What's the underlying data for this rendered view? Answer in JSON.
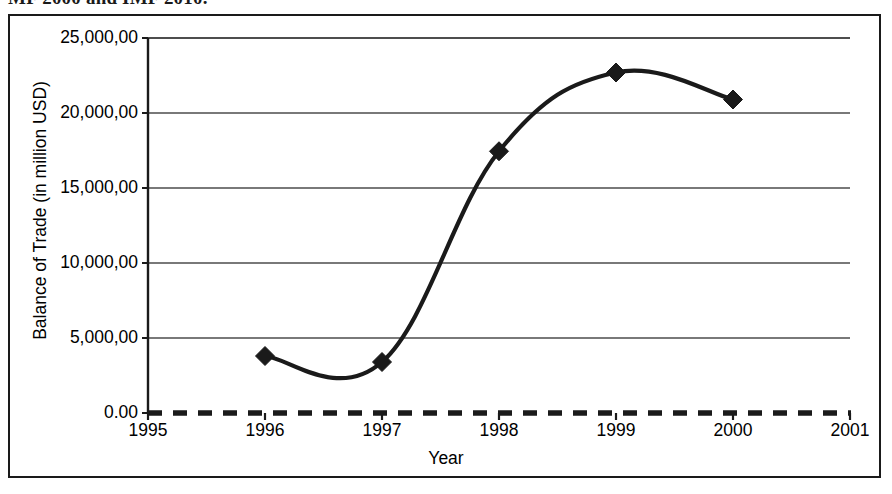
{
  "caption": {
    "text": "MF 2000 and IMF 2010."
  },
  "chart_data": {
    "type": "line",
    "title": "",
    "subtitle": "",
    "xlabel": "Year",
    "ylabel": "Balance of Trade (in million USD)",
    "x": [
      1996,
      1997,
      1998,
      1999,
      2000
    ],
    "values": [
      3800,
      3400,
      17450,
      22700,
      20900
    ],
    "series": [
      {
        "name": "Balance of Trade",
        "x": [
          1996,
          1997,
          1998,
          1999,
          2000
        ],
        "values": [
          3800,
          3400,
          17450,
          22700,
          20900
        ]
      }
    ],
    "xlim": [
      1995,
      2001
    ],
    "ylim": [
      0,
      25000
    ],
    "x_tick_labels": [
      "1995",
      "1996",
      "1997",
      "1998",
      "1999",
      "2000",
      "2001"
    ],
    "x_tick_values": [
      1995,
      1996,
      1997,
      1998,
      1999,
      2000,
      2001
    ],
    "y_tick_labels": [
      "0.00",
      "5,000,00",
      "10,000,00",
      "15,000,00",
      "20,000,00",
      "25,000,00"
    ],
    "y_tick_values": [
      0,
      5000,
      10000,
      15000,
      20000,
      25000
    ],
    "grid": "horizontal",
    "legend": "none",
    "smoothing": "spline",
    "marker": "diamond",
    "line_color": "#1a1a1a",
    "marker_color": "#1a1a1a",
    "grid_color": "#4d4d4d",
    "axis_color": "#1a1a1a",
    "background_color": "#ffffff",
    "zero_axis_style": "dashed"
  },
  "icons": {
    "marker_icon": "diamond-marker-icon"
  }
}
